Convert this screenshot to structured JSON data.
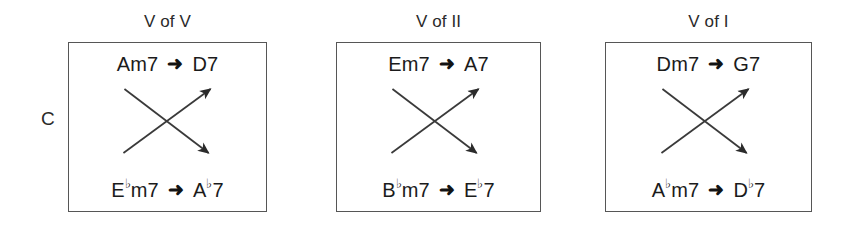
{
  "figure": {
    "key_label": "C",
    "arrow_glyph": "➜",
    "flat_symbol": "♭",
    "line_color": "#565656",
    "text_color": "#1b1b1b",
    "background": "#ffffff"
  },
  "groups": [
    {
      "id": "v-of-v",
      "title": "V of V",
      "top_row": {
        "from": "Am7",
        "to": "D7"
      },
      "bottom_row": {
        "from": "E♭m7",
        "to": "A♭7"
      },
      "cross": {
        "up_arrow": "lower-left-to-upper-right",
        "down_arrow": "upper-left-to-lower-right"
      }
    },
    {
      "id": "v-of-ii",
      "title": "V of II",
      "top_row": {
        "from": "Em7",
        "to": "A7"
      },
      "bottom_row": {
        "from": "B♭m7",
        "to": "E♭7"
      },
      "cross": {
        "up_arrow": "lower-left-to-upper-right",
        "down_arrow": "upper-left-to-lower-right"
      }
    },
    {
      "id": "v-of-i",
      "title": "V of I",
      "top_row": {
        "from": "Dm7",
        "to": "G7"
      },
      "bottom_row": {
        "from": "A♭m7",
        "to": "D♭7"
      },
      "cross": {
        "up_arrow": "lower-left-to-upper-right",
        "down_arrow": "upper-left-to-lower-right"
      }
    }
  ]
}
